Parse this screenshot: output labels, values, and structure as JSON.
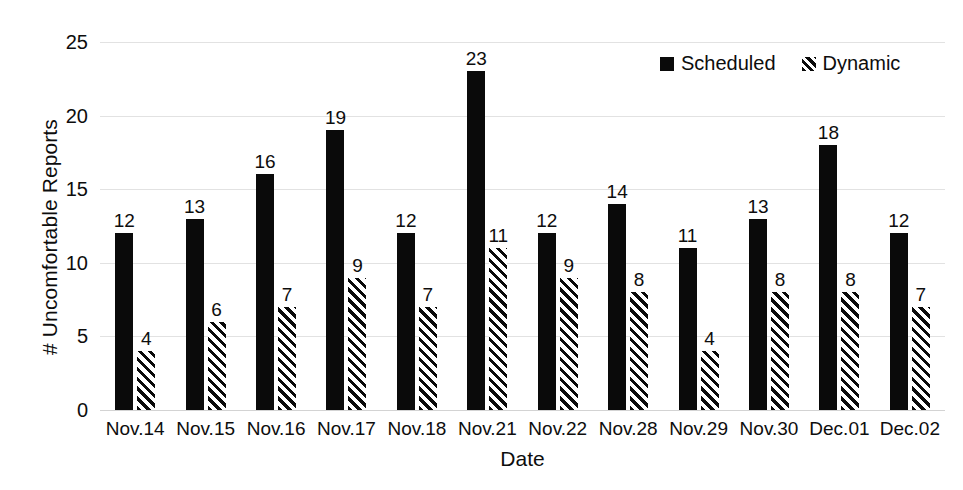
{
  "chart_data": {
    "type": "bar",
    "title": "",
    "xlabel": "Date",
    "ylabel": "# Uncomfortable Reports",
    "ylim": [
      0,
      25
    ],
    "yticks": [
      0,
      5,
      10,
      15,
      20,
      25
    ],
    "grid": true,
    "legend_position": "top-right",
    "categories": [
      "Nov.14",
      "Nov.15",
      "Nov.16",
      "Nov.17",
      "Nov.18",
      "Nov.21",
      "Nov.22",
      "Nov.28",
      "Nov.29",
      "Nov.30",
      "Dec.01",
      "Dec.02"
    ],
    "series": [
      {
        "name": "Scheduled",
        "marker": "solid-square",
        "color": "#0a0a0a",
        "values": [
          12,
          13,
          16,
          19,
          12,
          23,
          12,
          14,
          11,
          13,
          18,
          12
        ]
      },
      {
        "name": "Dynamic",
        "marker": "hatched-square",
        "color": "#0a0a0a",
        "values": [
          4,
          6,
          7,
          9,
          7,
          11,
          9,
          8,
          4,
          8,
          8,
          7
        ]
      }
    ]
  },
  "axis": {
    "y_title": "# Uncomfortable Reports",
    "x_title": "Date",
    "y_tick_labels": [
      "25",
      "20",
      "15",
      "10",
      "5",
      "0"
    ]
  },
  "legend": {
    "items": [
      {
        "label": "Scheduled"
      },
      {
        "label": "Dynamic"
      }
    ]
  }
}
